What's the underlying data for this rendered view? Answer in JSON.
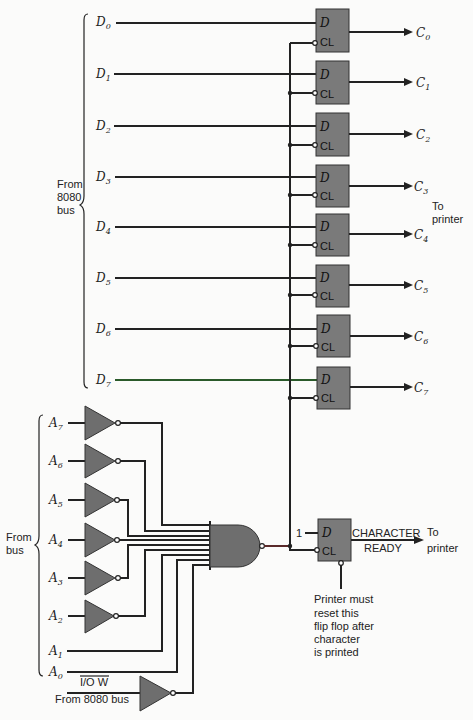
{
  "diagram": {
    "data_bus_group_label": [
      "From",
      "8080",
      "bus"
    ],
    "data_inputs": [
      {
        "name": "D",
        "sub": "0",
        "y": 22
      },
      {
        "name": "D",
        "sub": "1",
        "y": 74
      },
      {
        "name": "D",
        "sub": "2",
        "y": 126
      },
      {
        "name": "D",
        "sub": "3",
        "y": 177
      },
      {
        "name": "D",
        "sub": "4",
        "y": 227
      },
      {
        "name": "D",
        "sub": "5",
        "y": 278
      },
      {
        "name": "D",
        "sub": "6",
        "y": 329
      },
      {
        "name": "D",
        "sub": "7",
        "y": 380
      }
    ],
    "latches": [
      {
        "d_label": "D",
        "cl_label": "CL",
        "out": "C",
        "out_sub": "0",
        "top": 8
      },
      {
        "d_label": "D",
        "cl_label": "CL",
        "out": "C",
        "out_sub": "1",
        "top": 60
      },
      {
        "d_label": "D",
        "cl_label": "CL",
        "out": "C",
        "out_sub": "2",
        "top": 112
      },
      {
        "d_label": "D",
        "cl_label": "CL",
        "out": "C",
        "out_sub": "3",
        "top": 163
      },
      {
        "d_label": "D",
        "cl_label": "CL",
        "out": "C",
        "out_sub": "4",
        "top": 213
      },
      {
        "d_label": "D",
        "cl_label": "CL",
        "out": "C",
        "out_sub": "5",
        "top": 264
      },
      {
        "d_label": "D",
        "cl_label": "CL",
        "out": "C",
        "out_sub": "6",
        "top": 315
      },
      {
        "d_label": "D",
        "cl_label": "CL",
        "out": "C",
        "out_sub": "7",
        "top": 366
      }
    ],
    "to_printer_label": [
      "To",
      "printer"
    ],
    "address_group_label": [
      "From",
      "bus"
    ],
    "address_inverted": [
      {
        "name": "A",
        "sub": "7",
        "y": 423
      },
      {
        "name": "A",
        "sub": "6",
        "y": 461
      },
      {
        "name": "A",
        "sub": "5",
        "y": 500
      },
      {
        "name": "A",
        "sub": "4",
        "y": 540
      },
      {
        "name": "A",
        "sub": "3",
        "y": 578
      },
      {
        "name": "A",
        "sub": "2",
        "y": 616
      }
    ],
    "address_direct": [
      {
        "name": "A",
        "sub": "1",
        "y": 651
      },
      {
        "name": "A",
        "sub": "0",
        "y": 672
      }
    ],
    "iow": {
      "label": "I/O W",
      "source": "From 8080 bus"
    },
    "status_ff": {
      "d_input": "1",
      "d_label": "D",
      "cl_label": "CL",
      "output_line1": "CHARACTER",
      "output_line2": "READY",
      "dest": [
        "To",
        "printer"
      ],
      "note": [
        "Printer must",
        "reset this",
        "flip flop after",
        "character",
        "is printed"
      ]
    }
  }
}
